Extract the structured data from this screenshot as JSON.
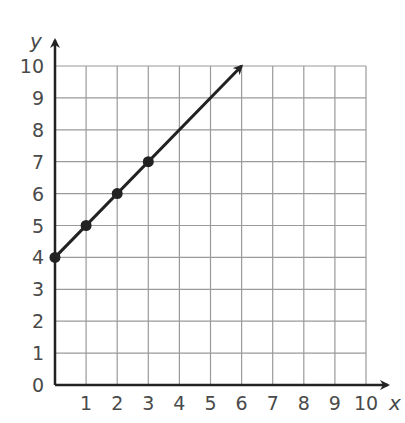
{
  "chart_data": {
    "type": "line",
    "title": "",
    "xlabel": "x",
    "ylabel": "y",
    "xlim": [
      0,
      10
    ],
    "ylim": [
      0,
      10
    ],
    "grid": true,
    "x_ticks": [
      "1",
      "2",
      "3",
      "4",
      "5",
      "6",
      "7",
      "8",
      "9",
      "10"
    ],
    "y_ticks": [
      "0",
      "1",
      "2",
      "3",
      "4",
      "5",
      "6",
      "7",
      "8",
      "9",
      "10"
    ],
    "points": [
      {
        "x": 0,
        "y": 4
      },
      {
        "x": 1,
        "y": 5
      },
      {
        "x": 2,
        "y": 6
      },
      {
        "x": 3,
        "y": 7
      }
    ],
    "line": {
      "from": {
        "x": 0,
        "y": 4
      },
      "to": {
        "x": 6,
        "y": 10
      },
      "arrow_end": true,
      "equation": "y = x + 4"
    },
    "colors": {
      "line": "#222222",
      "grid": "#9a9a9a",
      "axis": "#222222",
      "text": "#4a4a4a"
    }
  }
}
